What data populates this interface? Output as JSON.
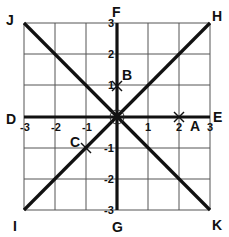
{
  "diagram": {
    "type": "coordinate-grid",
    "x_range": [
      -3,
      3
    ],
    "y_range": [
      -3,
      3
    ],
    "grid_step": 1,
    "x_ticks": [
      "-3",
      "-2",
      "-1",
      "1",
      "2",
      "3"
    ],
    "y_ticks": [
      "3",
      "2",
      "1",
      "-1",
      "-2",
      "-3"
    ],
    "lines": [
      {
        "name": "D-E",
        "from": "D",
        "to": "E",
        "description": "horizontal axis"
      },
      {
        "name": "F-G",
        "from": "F",
        "to": "G",
        "description": "vertical axis"
      },
      {
        "name": "J-K",
        "from": "J",
        "to": "K",
        "description": "diagonal"
      },
      {
        "name": "I-H",
        "from": "I",
        "to": "H",
        "description": "diagonal"
      }
    ],
    "endpoint_labels": {
      "D": "D",
      "E": "E",
      "F": "F",
      "G": "G",
      "H": "H",
      "I": "I",
      "J": "J",
      "K": "K"
    },
    "points": [
      {
        "label": "A",
        "x": 2,
        "y": 0
      },
      {
        "label": "B",
        "x": 0,
        "y": 1
      },
      {
        "label": "C",
        "x": -1,
        "y": -1
      }
    ],
    "origin_marker": "circle"
  }
}
